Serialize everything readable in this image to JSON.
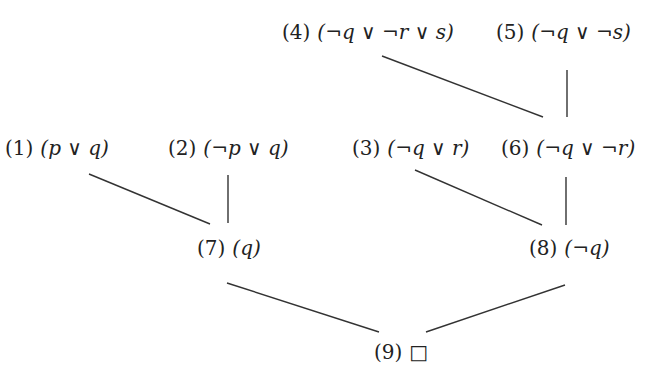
{
  "diagram": {
    "type": "resolution-tree",
    "nodes": [
      {
        "id": "4",
        "number": "(4)",
        "clause": "(¬q ∨ ¬r ∨ s)",
        "x": 282,
        "y": 22
      },
      {
        "id": "5",
        "number": "(5)",
        "clause": "(¬q ∨ ¬s)",
        "x": 496,
        "y": 22
      },
      {
        "id": "1",
        "number": "(1)",
        "clause": "(p ∨ q)",
        "x": 5,
        "y": 138
      },
      {
        "id": "2",
        "number": "(2)",
        "clause": "(¬p ∨ q)",
        "x": 168,
        "y": 138
      },
      {
        "id": "3",
        "number": "(3)",
        "clause": "(¬q ∨ r)",
        "x": 352,
        "y": 138
      },
      {
        "id": "6",
        "number": "(6)",
        "clause": "(¬q ∨ ¬r)",
        "x": 501,
        "y": 138
      },
      {
        "id": "7",
        "number": "(7)",
        "clause": "(q)",
        "x": 197,
        "y": 238
      },
      {
        "id": "8",
        "number": "(8)",
        "clause": "(¬q)",
        "x": 529,
        "y": 238
      },
      {
        "id": "9",
        "number": "(9)",
        "clause": "□",
        "x": 374,
        "y": 342
      }
    ],
    "edges": [
      {
        "from": "4",
        "to": "6",
        "x1": 382,
        "y1": 56,
        "x2": 543,
        "y2": 117
      },
      {
        "from": "5",
        "to": "6",
        "x1": 567,
        "y1": 70,
        "x2": 567,
        "y2": 117
      },
      {
        "from": "1",
        "to": "7",
        "x1": 89,
        "y1": 174,
        "x2": 210,
        "y2": 224
      },
      {
        "from": "2",
        "to": "7",
        "x1": 228,
        "y1": 175,
        "x2": 228,
        "y2": 223
      },
      {
        "from": "3",
        "to": "8",
        "x1": 415,
        "y1": 170,
        "x2": 542,
        "y2": 225
      },
      {
        "from": "6",
        "to": "8",
        "x1": 566,
        "y1": 177,
        "x2": 566,
        "y2": 225
      },
      {
        "from": "7",
        "to": "9",
        "x1": 227,
        "y1": 283,
        "x2": 379,
        "y2": 332
      },
      {
        "from": "8",
        "to": "9",
        "x1": 565,
        "y1": 285,
        "x2": 426,
        "y2": 332
      }
    ],
    "colors": {
      "line": "#333333",
      "text": "#222222",
      "background": "#ffffff"
    }
  }
}
